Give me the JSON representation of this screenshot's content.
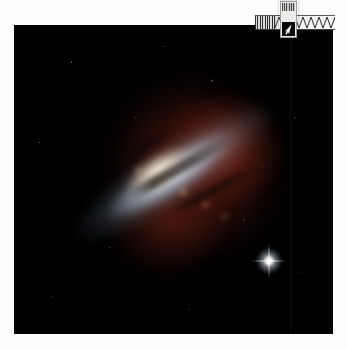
{
  "page": {
    "background_color": "#fdfdfd"
  },
  "photo": {
    "name": "cigar-galaxy-m82",
    "alt": "Edge-on starburst galaxy with red hydrogen outflows against black space",
    "background_color": "#000000",
    "frame": {
      "left": 14,
      "top": 25,
      "width": 319,
      "height": 309
    },
    "features": {
      "disk_label": "galaxy-disk",
      "core_label": "starburst-core",
      "outflow_label": "red-hydrogen-outflow",
      "foreground_star_label": "bright-foreground-star"
    },
    "colors": {
      "sky": "#000000",
      "disk": "#c4d6e2",
      "core": "#fffaee",
      "outflow": "#962a1a",
      "dust_lane": "#140806",
      "star": "#ffffff"
    }
  },
  "overlay": {
    "name": "overlay-widget",
    "waveform": {
      "name": "waveform-band",
      "bars_color": "#2b2b2b",
      "band_color": "#f2f2f0",
      "zigzag_color": "#2f2f2f",
      "peaks": 7
    },
    "thumbnail_card": {
      "name": "thumbnail-card",
      "label_color": "#9c9c9a",
      "image_color": "#0a0a0a",
      "cursor_color": "#ffffff"
    }
  }
}
